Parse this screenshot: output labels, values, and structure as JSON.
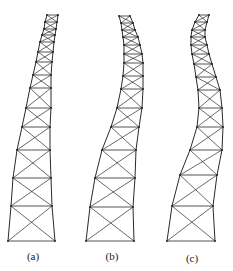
{
  "figure": {
    "stroke_color": "#2a2a2a",
    "background": "#ffffff",
    "panels": [
      {
        "id": "a",
        "label": "(a)",
        "label_pos": [
          33,
          250
        ],
        "rows": [
          [
            47,
            58,
            15
          ],
          [
            45,
            57,
            22
          ],
          [
            44,
            56,
            29
          ],
          [
            42,
            55,
            35
          ],
          [
            40,
            54,
            42
          ],
          [
            38,
            53,
            52
          ],
          [
            36,
            52,
            62
          ],
          [
            33,
            51,
            75
          ],
          [
            30,
            51,
            88
          ],
          [
            26,
            51,
            108
          ],
          [
            22,
            50,
            127
          ],
          [
            17,
            50,
            150
          ],
          [
            13,
            51,
            178
          ],
          [
            11,
            52,
            206
          ],
          [
            8,
            55,
            241
          ]
        ]
      },
      {
        "id": "b",
        "label": "(b)",
        "label_pos": [
          112,
          250
        ],
        "rows": [
          [
            119,
            130,
            16
          ],
          [
            121,
            133,
            23
          ],
          [
            122,
            135,
            30
          ],
          [
            123,
            138,
            37
          ],
          [
            124,
            140,
            45
          ],
          [
            124,
            142,
            54
          ],
          [
            124,
            143,
            63
          ],
          [
            123,
            143,
            76
          ],
          [
            121,
            143,
            89
          ],
          [
            117,
            142,
            108
          ],
          [
            111,
            139,
            127
          ],
          [
            102,
            136,
            150
          ],
          [
            95,
            135,
            178
          ],
          [
            90,
            133,
            207
          ],
          [
            86,
            134,
            241
          ]
        ]
      },
      {
        "id": "c",
        "label": "(c)",
        "label_pos": [
          192,
          252
        ],
        "rows": [
          [
            199,
            209,
            15
          ],
          [
            195,
            207,
            22
          ],
          [
            192,
            205,
            30
          ],
          [
            191,
            205,
            37
          ],
          [
            191,
            207,
            45
          ],
          [
            192,
            209,
            54
          ],
          [
            194,
            212,
            64
          ],
          [
            196,
            216,
            77
          ],
          [
            198,
            220,
            90
          ],
          [
            199,
            222,
            108
          ],
          [
            197,
            223,
            127
          ],
          [
            190,
            222,
            150
          ],
          [
            180,
            217,
            175
          ],
          [
            172,
            213,
            206
          ],
          [
            167,
            215,
            241
          ]
        ]
      }
    ]
  }
}
